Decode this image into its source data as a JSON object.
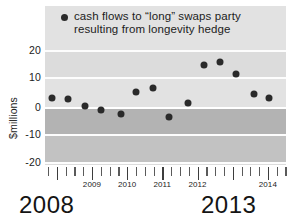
{
  "legend": {
    "marker": "filled-circle",
    "line1": "cash flows to “long” swaps party",
    "line2": "resulting from longevity hedge",
    "text": "cash flows to “long” swaps party resulting from longevity hedge"
  },
  "axes": {
    "y_title": "$millions",
    "y_ticks": [
      "20",
      "10",
      "0",
      "-10",
      "-20"
    ],
    "x_tick_labels": [
      "2009",
      "2010",
      "2011",
      "2012",
      "2014"
    ],
    "big_year_start": "2008",
    "big_year_end": "2013"
  },
  "colors": {
    "marker": "#2a2a2a",
    "plot_background": "#d9d9d9",
    "gridline": "#fdfdfd",
    "band_light": "#e2e2e2",
    "band_dark": "#b3b3b3",
    "text": "#1a1a1a"
  },
  "chart_data": {
    "type": "scatter",
    "title": "",
    "subtitle": "",
    "xlabel": "",
    "ylabel": "$millions",
    "ylim": [
      -24,
      26
    ],
    "yticks": [
      20,
      10,
      0,
      -10,
      -20
    ],
    "xlim": [
      "2008.0",
      "2014.9"
    ],
    "grid": true,
    "legend_position": "top-inside",
    "annotations": [
      "2008",
      "2013"
    ],
    "series": [
      {
        "name": "cash flows to “long” swaps party resulting from longevity hedge",
        "marker": "circle",
        "color": "#2a2a2a",
        "x": [
          "2008.2",
          "2008.6",
          "2009.1",
          "2009.5",
          "2010.0",
          "2010.4",
          "2010.9",
          "2011.3",
          "2011.8",
          "2012.3",
          "2012.7",
          "2013.1",
          "2013.6",
          "2014.1"
        ],
        "values": [
          3.4,
          2.8,
          0.4,
          -1.2,
          -2.6,
          5.4,
          7.2,
          -3.7,
          1.6,
          15.4,
          16.6,
          12.4,
          5.0,
          3.2
        ]
      }
    ]
  },
  "points": [
    {
      "px": 22,
      "v": 3.4
    },
    {
      "px": 68,
      "v": 2.8
    },
    {
      "px": 121,
      "v": 0.4
    },
    {
      "px": 170,
      "v": -1.2
    },
    {
      "px": 228,
      "v": -2.6
    },
    {
      "px": 274,
      "v": 5.4
    },
    {
      "px": 325,
      "v": 7.2
    },
    {
      "px": 375,
      "v": -3.7
    },
    {
      "px": 430,
      "v": 1.6
    },
    {
      "px": 478,
      "v": 15.4
    },
    {
      "px": 527,
      "v": 16.6
    },
    {
      "px": 575,
      "v": 12.4
    },
    {
      "px": 630,
      "v": 5.0
    },
    {
      "px": 676,
      "v": 3.2
    }
  ]
}
